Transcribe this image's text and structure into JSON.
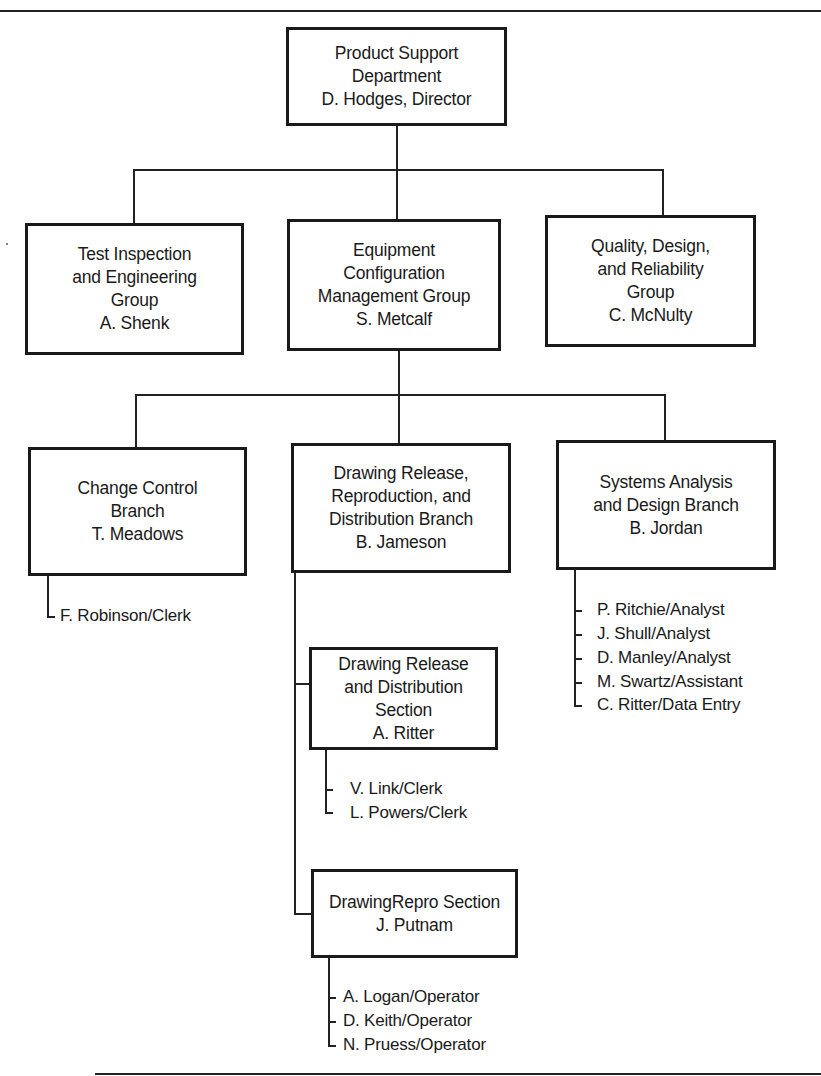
{
  "chart": {
    "type": "organization-chart",
    "root": {
      "title_lines": [
        "Product Support",
        "Department",
        "D. Hodges, Director"
      ]
    },
    "groups": [
      {
        "title_lines": [
          "Test Inspection",
          "and Engineering",
          "Group",
          "A. Shenk"
        ]
      },
      {
        "title_lines": [
          "Equipment",
          "Configuration",
          "Management Group",
          "S. Metcalf"
        ]
      },
      {
        "title_lines": [
          "Quality, Design,",
          "and Reliability",
          "Group",
          "C. McNulty"
        ]
      }
    ],
    "branches": [
      {
        "title_lines": [
          "Change Control",
          "Branch",
          "T. Meadows"
        ],
        "staff": [
          "F. Robinson/Clerk"
        ]
      },
      {
        "title_lines": [
          "Drawing Release,",
          "Reproduction, and",
          "Distribution Branch",
          "B. Jameson"
        ],
        "sections": [
          {
            "title_lines": [
              "Drawing Release",
              "and Distribution",
              "Section",
              "A. Ritter"
            ],
            "staff": [
              "V. Link/Clerk",
              "L. Powers/Clerk"
            ]
          },
          {
            "title_lines": [
              "DrawingRepro Section",
              "J. Putnam"
            ],
            "staff": [
              "A. Logan/Operator",
              "D. Keith/Operator",
              "N. Pruess/Operator"
            ]
          }
        ]
      },
      {
        "title_lines": [
          "Systems Analysis",
          "and Design Branch",
          "B. Jordan"
        ],
        "staff": [
          "P. Ritchie/Analyst",
          "J. Shull/Analyst",
          "D. Manley/Analyst",
          "M. Swartz/Assistant",
          "C. Ritter/Data Entry"
        ]
      }
    ]
  }
}
